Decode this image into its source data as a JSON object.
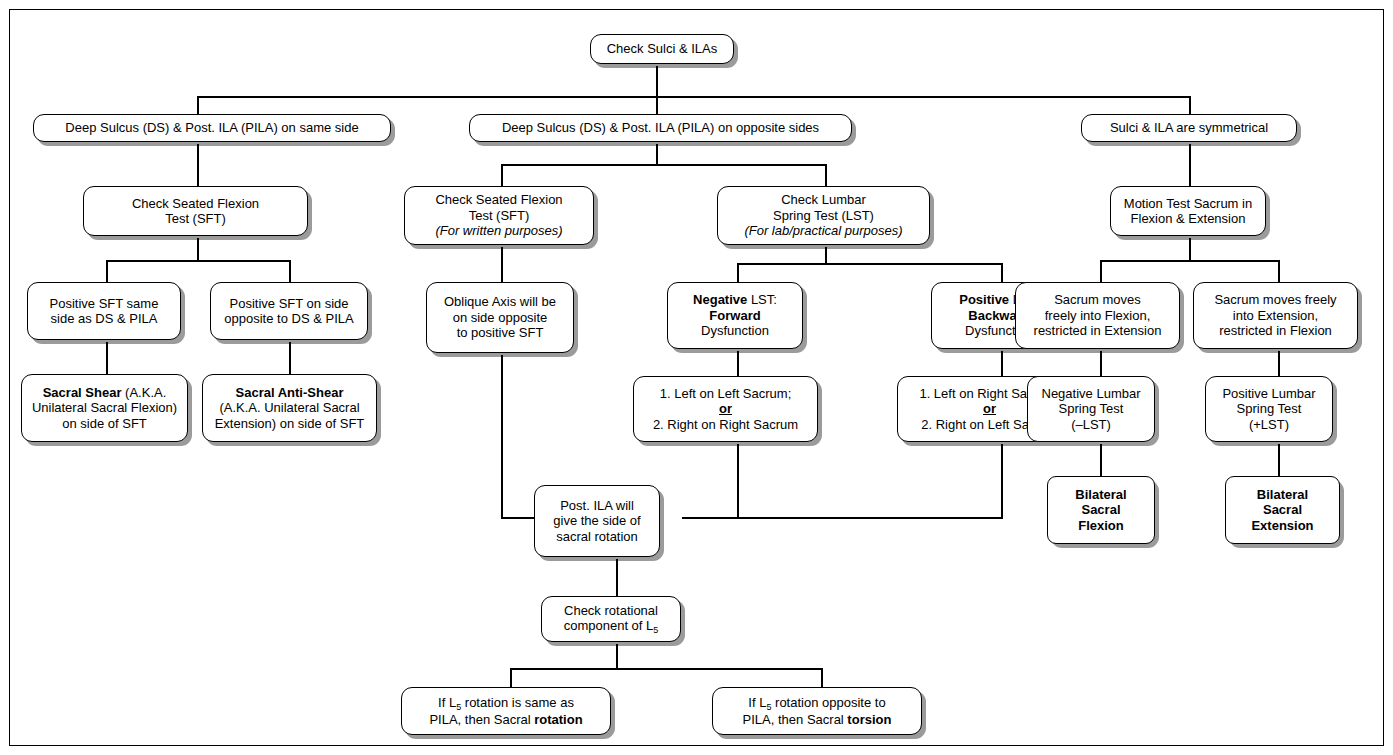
{
  "diagram": {
    "nodes": {
      "root": "Check Sulci & ILAs",
      "branch_same": "Deep Sulcus (DS) & Post. ILA (PILA) on same side",
      "branch_opposite": "Deep Sulcus (DS) & Post. ILA (PILA) on opposite sides",
      "branch_symmetrical": "Sulci & ILA are symmetrical",
      "sft_left_l1": "Check Seated Flexion",
      "sft_left_l2": "Test (SFT)",
      "sft_mid_l1": "Check Seated Flexion",
      "sft_mid_l2": "Test (SFT)",
      "sft_mid_l3": "(For written purposes)",
      "lst_l1": "Check Lumbar",
      "lst_l2": "Spring Test (LST)",
      "lst_l3": "(For lab/practical purposes)",
      "motion_l1": "Motion Test Sacrum in",
      "motion_l2": "Flexion & Extension",
      "pos_sft_same_l1": "Positive SFT same",
      "pos_sft_same_l2": "side as DS & PILA",
      "pos_sft_opp_l1": "Positive SFT on side",
      "pos_sft_opp_l2": "opposite to DS & PILA",
      "oblique_l1": "Oblique Axis will be",
      "oblique_l2": "on side opposite",
      "oblique_l3": "to positive SFT",
      "neg_lst_b": "Negative",
      "neg_lst_rest": " LST:",
      "neg_lst_l2": "Forward",
      "neg_lst_l3": "Dysfunction",
      "pos_lst_b": "Positive",
      "pos_lst_rest": " LST:",
      "pos_lst_l2": "Backward",
      "pos_lst_l3": "Dysfunction",
      "sac_free_flex_l1": "Sacrum moves",
      "sac_free_flex_l2": "freely into Flexion,",
      "sac_free_flex_l3": "restricted in Extension",
      "sac_free_ext_l1": "Sacrum moves freely",
      "sac_free_ext_l2": "into Extension,",
      "sac_free_ext_l3": "restricted in Flexion",
      "shear_b": "Sacral Shear",
      "shear_rest": " (A.K.A.",
      "shear_l2": "Unilateral Sacral Flexion)",
      "shear_l3": "on side of SFT",
      "antishear_b": "Sacral  Anti-Shear",
      "antishear_l2": "(A.K.A. Unilateral Sacral",
      "antishear_l3": "Extension) on side of SFT",
      "left_left_l1": "1. Left on Left Sacrum;",
      "left_left_or": "or",
      "left_left_l3": "2. Right on Right Sacrum",
      "left_right_l1": "1. Left on Right Sacrum;",
      "left_right_or": "or",
      "left_right_l3": "2. Right on Left Sacrum",
      "neg_lumbar_l1": "Negative Lumbar",
      "neg_lumbar_l2": "Spring Test",
      "neg_lumbar_l3": "(–LST)",
      "pos_lumbar_l1": "Positive Lumbar",
      "pos_lumbar_l2": "Spring Test",
      "pos_lumbar_l3": "(+LST)",
      "bilat_flex_l1": "Bilateral",
      "bilat_flex_l2": "Sacral",
      "bilat_flex_l3": "Flexion",
      "bilat_ext_l1": "Bilateral",
      "bilat_ext_l2": "Sacral",
      "bilat_ext_l3": "Extension",
      "post_ila_l1": "Post. ILA will",
      "post_ila_l2": "give the side of",
      "post_ila_l3": "sacral rotation",
      "check_rot_l1": "Check rotational",
      "check_rot_l2a": "component of L",
      "check_rot_l2b": "5",
      "rot_same_a": "If L",
      "rot_same_sub": "5",
      "rot_same_b": " rotation is same as",
      "rot_same_l2a": "PILA, then Sacral ",
      "rot_same_l2b": "rotation",
      "rot_opp_a": "If L",
      "rot_opp_sub": "5",
      "rot_opp_b": " rotation opposite to",
      "rot_opp_l2a": "PILA, then Sacral ",
      "rot_opp_l2b": "torsion"
    },
    "colors": {
      "border": "#000000",
      "fill": "#ffffff",
      "shadow": "#9b9b9b",
      "text": "#000000"
    }
  }
}
